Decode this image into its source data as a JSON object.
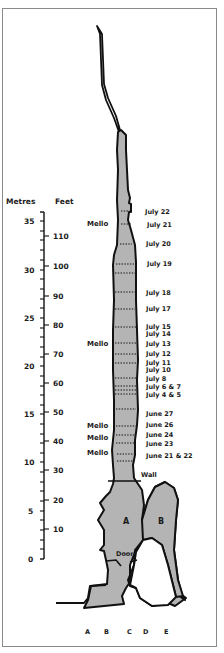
{
  "diagram": {
    "type": "cave-shaft-cross-section",
    "axes": {
      "metres": {
        "title": "Metres",
        "ticks": [
          "35",
          "30",
          "25",
          "20",
          "15",
          "10",
          "5",
          "0"
        ]
      },
      "feet": {
        "title": "Feet",
        "ticks": [
          "110",
          "100",
          "90",
          "80",
          "70",
          "60",
          "50",
          "40",
          "30",
          "20",
          "10"
        ]
      }
    },
    "date_levels": [
      "July 22",
      "July 21",
      "July 20",
      "July 19",
      "July 18",
      "July 17",
      "July 15",
      "July 14",
      "July 13",
      "July 12",
      "July 11",
      "July 10",
      "July 8",
      "July 6 & 7",
      "July 4 & 5",
      "June 27",
      "June 26",
      "June 24",
      "June 23",
      "June 21 & 22"
    ],
    "mello_labels": [
      "Mello",
      "Mello",
      "Mello",
      "Mello",
      "Mello"
    ],
    "features": {
      "wall": "Wall",
      "door": "Door",
      "chamber_a": "A",
      "chamber_b": "B"
    },
    "columns": [
      "A",
      "B",
      "C",
      "D",
      "E"
    ],
    "colors": {
      "fill": "#b4b4b4",
      "outline": "#111111",
      "frame": "#8a8a8a"
    }
  }
}
